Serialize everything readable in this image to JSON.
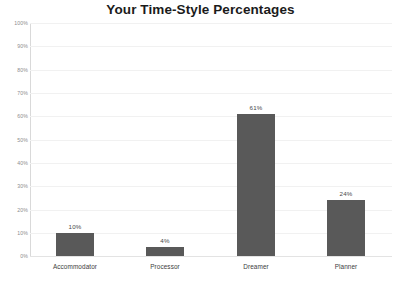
{
  "chart_data": {
    "type": "bar",
    "title": "Your Time-Style Percentages",
    "categories": [
      "Accommodator",
      "Processor",
      "Dreamer",
      "Planner"
    ],
    "values": [
      10,
      4,
      61,
      24
    ],
    "data_labels": [
      "10%",
      "4%",
      "61%",
      "24%"
    ],
    "xlabel": "",
    "ylabel": "",
    "ylim": [
      0,
      100
    ],
    "ytick_step": 10,
    "ytick_labels": [
      "100%",
      "90%",
      "80%",
      "70%",
      "60%",
      "50%",
      "40%",
      "30%",
      "20%",
      "10%",
      "0%"
    ],
    "ytick_values": [
      100,
      90,
      80,
      70,
      60,
      50,
      40,
      30,
      20,
      10,
      0
    ],
    "grid": true,
    "grid_axis": "y",
    "legend": false,
    "legend_position": "none",
    "colors": {
      "bar": "#595959",
      "background": "#ffffff",
      "gridline": "#f1f1f1",
      "axis_line": "#d9d9d9",
      "baseline": "#e3e3e3",
      "title_text": "#1b1b1b",
      "tick_text": "#8d8d8d",
      "category_text": "#3d3d3d",
      "value_text": "#4a4a4a"
    }
  }
}
